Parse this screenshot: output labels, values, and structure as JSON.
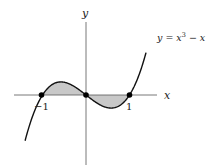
{
  "chart_data": {
    "type": "line",
    "title": "",
    "function": "y = x^3 - x",
    "curve_label": "y = x³ − x",
    "xlabel": "x",
    "ylabel": "y",
    "x_ticks": [
      {
        "value": -1,
        "label": "−1"
      },
      {
        "value": 1,
        "label": "1"
      }
    ],
    "xlim": [
      -1.7,
      1.65
    ],
    "ylim": [
      -2.1,
      2.5
    ],
    "grid": false,
    "marked_points": [
      {
        "x": -1,
        "y": 0
      },
      {
        "x": 0,
        "y": 0
      },
      {
        "x": 1,
        "y": 0
      }
    ],
    "shaded_regions": [
      {
        "from": -1,
        "to": 0,
        "between": "curve and x-axis",
        "color": "#c8c8c8"
      },
      {
        "from": 0,
        "to": 1,
        "between": "curve and x-axis",
        "color": "#c8c8c8"
      }
    ],
    "series": [
      {
        "name": "y = x³ − x",
        "x_range": [
          -1.4,
          1.38
        ],
        "color": "#111111"
      }
    ]
  },
  "labels": {
    "x_axis": "x",
    "y_axis": "y",
    "curve_prefix": "y = x",
    "curve_exp": "3",
    "curve_suffix": " − x",
    "tick_neg1": "−1",
    "tick_1": "1"
  },
  "colors": {
    "curve": "#111111",
    "axes": "#555555",
    "shade": "#c8c8c8",
    "points": "#000000"
  }
}
